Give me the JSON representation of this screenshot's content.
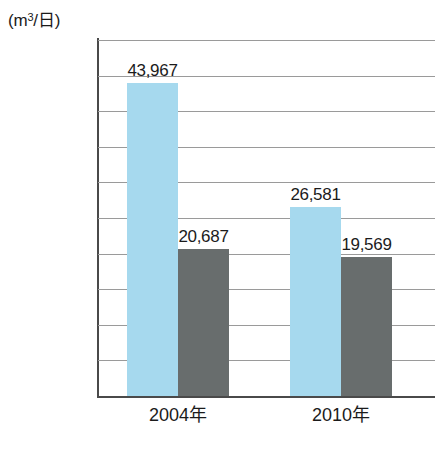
{
  "chart_data": {
    "type": "bar",
    "title": "",
    "xlabel": "",
    "ylabel": "(m3/日)",
    "unit_prefix": "(m",
    "unit_superscript": "3",
    "unit_suffix": "/日)",
    "categories": [
      "2004年",
      "2010年"
    ],
    "series": [
      {
        "name": "series-blue",
        "color": "#a6d9ee",
        "values": [
          43967,
          26581
        ],
        "labels": [
          "43,967",
          "26,581"
        ]
      },
      {
        "name": "series-gray",
        "color": "#686d6d",
        "values": [
          20687,
          19569
        ],
        "labels": [
          "20,687",
          "19,569"
        ]
      }
    ],
    "ylim": [
      0,
      50000
    ],
    "ytick_step": 5000,
    "ytick_labels": [
      "50,000",
      "45,000",
      "40,000",
      "35,000",
      "30,000",
      "25,000",
      "20,000",
      "15,000",
      "10,000",
      "5,000",
      "0"
    ],
    "ytick_values": [
      50000,
      45000,
      40000,
      35000,
      30000,
      25000,
      20000,
      15000,
      10000,
      5000,
      0
    ],
    "grid": true,
    "legend": "none"
  }
}
